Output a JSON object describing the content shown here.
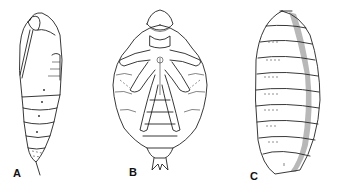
{
  "figure": {
    "panels": [
      {
        "id": "A",
        "label": "A",
        "subject": "obtect pupa (lateral view)"
      },
      {
        "id": "B",
        "label": "B",
        "subject": "exarate pupa (ventral view)"
      },
      {
        "id": "C",
        "label": "C",
        "subject": "coarctate pupa / puparium"
      }
    ],
    "colors": {
      "line": "#222222",
      "background": "#ffffff"
    }
  }
}
